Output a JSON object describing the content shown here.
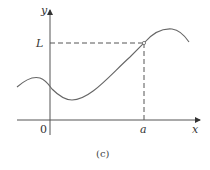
{
  "figure": {
    "caption": "(c)",
    "axes": {
      "x_label": "x",
      "y_label": "y",
      "origin_label": "0"
    },
    "markers": {
      "x_tick_label": "a",
      "y_tick_label": "L"
    },
    "colors": {
      "stroke": "#555555",
      "curve": "#666666",
      "text": "#333333"
    }
  }
}
